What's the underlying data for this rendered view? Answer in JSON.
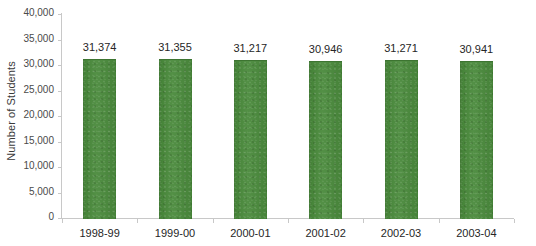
{
  "chart_data": {
    "type": "bar",
    "title": "",
    "xlabel": "",
    "ylabel": "Number of Students",
    "categories": [
      "1998-99",
      "1999-00",
      "2000-01",
      "2001-02",
      "2002-03",
      "2003-04"
    ],
    "values": [
      31374,
      31355,
      31217,
      30946,
      31271,
      30941
    ],
    "value_labels": [
      "31,374",
      "31,355",
      "31,217",
      "30,946",
      "31,271",
      "30,941"
    ],
    "ylim": [
      0,
      40000
    ],
    "ytick_values": [
      0,
      5000,
      10000,
      15000,
      20000,
      25000,
      30000,
      35000,
      40000
    ],
    "ytick_labels": [
      "0",
      "5,000",
      "10,000",
      "15,000",
      "20,000",
      "25,000",
      "30,000",
      "35,000",
      "40,000"
    ],
    "grid": false,
    "legend": false,
    "series": [
      {
        "name": "Number of Students",
        "color": "#4a8a3c",
        "values": [
          31374,
          31355,
          31217,
          30946,
          31271,
          30941
        ]
      }
    ]
  },
  "colors": {
    "bar_fill": "#4a8a3c",
    "bar_edge": "#3d7431",
    "axis_line": "#c8c8c8",
    "label_text": "#262626",
    "tick_text": "#4a4a4a",
    "background": "#ffffff"
  }
}
